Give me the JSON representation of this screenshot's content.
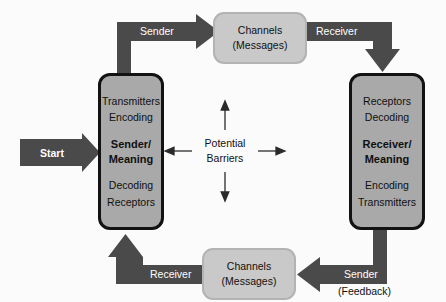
{
  "diagram": {
    "colors": {
      "background": "#fbfbfb",
      "arrow_band": "#4a4a4a",
      "party_box_fill": "#a9a9a9",
      "party_box_border": "#121212",
      "channel_box_fill": "#c9c9c9",
      "channel_box_border": "#b3b3b3",
      "band_label_text": "#ffffff",
      "plain_label_text": "#101010"
    },
    "start": {
      "label": "Start"
    },
    "sender_box": {
      "name": "sender-party-box",
      "top_lines": [
        "Transmitters",
        "Encoding"
      ],
      "middle_lines": [
        "Sender/",
        "Meaning"
      ],
      "bottom_lines": [
        "Decoding",
        "Receptors"
      ]
    },
    "receiver_box": {
      "name": "receiver-party-box",
      "top_lines": [
        "Receptors",
        "Decoding"
      ],
      "middle_lines": [
        "Receiver/",
        "Meaning"
      ],
      "bottom_lines": [
        "Encoding",
        "Transmitters"
      ]
    },
    "channels_top": {
      "line1": "Channels",
      "line2": "(Messages)"
    },
    "channels_bottom": {
      "line1": "Channels",
      "line2": "(Messages)"
    },
    "center": {
      "line1": "Potential",
      "line2": "Barriers"
    },
    "flow_labels": {
      "top_left": "Sender",
      "top_right": "Receiver",
      "bottom_right": "Sender",
      "bottom_right_sub": "(Feedback)",
      "bottom_left": "Receiver"
    }
  }
}
